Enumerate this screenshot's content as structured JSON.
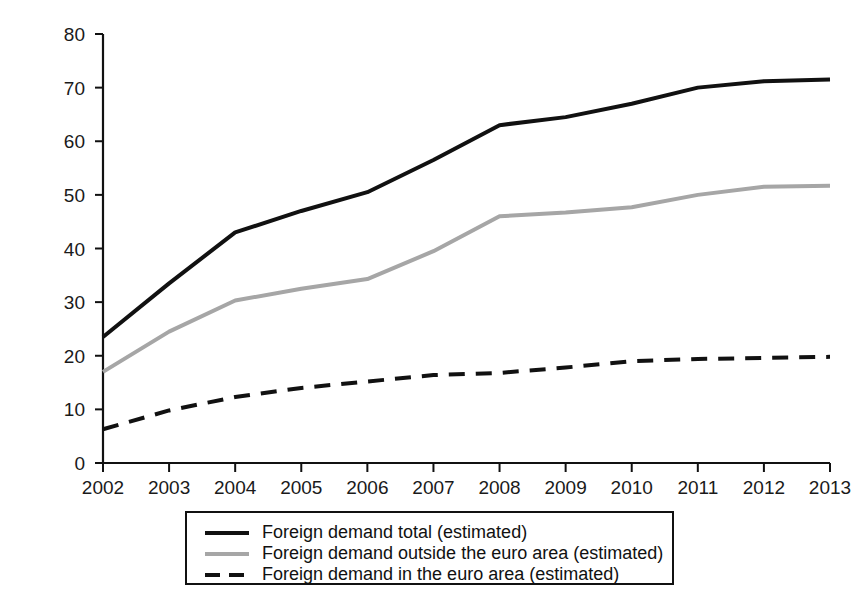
{
  "chart_data": {
    "type": "line",
    "title": "",
    "subtitle": "",
    "xlabel": "",
    "ylabel": "",
    "x": [
      2002,
      2003,
      2004,
      2005,
      2006,
      2007,
      2008,
      2009,
      2010,
      2011,
      2012,
      2013
    ],
    "xtick_labels": [
      "2002",
      "2003",
      "2004",
      "2005",
      "2006",
      "2007",
      "2008",
      "2009",
      "2010",
      "2011",
      "2012",
      "2013"
    ],
    "ytick_labels": [
      "0",
      "10",
      "20",
      "30",
      "40",
      "50",
      "60",
      "70",
      "80"
    ],
    "yticks": [
      0,
      10,
      20,
      30,
      40,
      50,
      60,
      70,
      80
    ],
    "xlim": [
      2002,
      2013
    ],
    "ylim": [
      0,
      80
    ],
    "grid": false,
    "legend_position": "below-center",
    "series": [
      {
        "name": "Foreign demand total (estimated)",
        "style": "solid",
        "color": "#111111",
        "width": 4,
        "values": [
          23.5,
          33.5,
          43.0,
          47.0,
          50.5,
          56.5,
          63.0,
          64.5,
          67.0,
          70.0,
          71.2,
          71.5
        ]
      },
      {
        "name": "Foreign demand outside the euro area (estimated)",
        "style": "solid",
        "color": "#a6a6a6",
        "width": 4,
        "values": [
          17.0,
          24.5,
          30.3,
          32.5,
          34.3,
          39.5,
          46.0,
          46.7,
          47.7,
          50.0,
          51.5,
          51.7
        ]
      },
      {
        "name": "Foreign demand in the euro area (estimated)",
        "style": "dashed",
        "color": "#111111",
        "width": 4,
        "values": [
          6.3,
          9.8,
          12.3,
          14.0,
          15.2,
          16.4,
          16.8,
          17.8,
          19.0,
          19.4,
          19.6,
          19.8
        ]
      }
    ],
    "legend": [
      "Foreign demand total (estimated)",
      "Foreign demand outside the euro area (estimated)",
      "Foreign demand in the euro area (estimated)"
    ]
  }
}
